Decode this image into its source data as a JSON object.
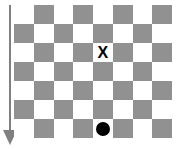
{
  "figure": {
    "title": "",
    "background_color": "#ffffff",
    "width": 178,
    "height": 149
  },
  "arrow": {
    "name": "downward-arrow",
    "direction": "down",
    "color": "#808080",
    "label": ""
  },
  "board": {
    "columns": 8,
    "rows": 7,
    "light_color": "#ffffff",
    "dark_color": "#919191",
    "start_square_color": "light",
    "cells": [
      [
        "light",
        "dark",
        "light",
        "dark",
        "light",
        "dark",
        "light",
        "dark"
      ],
      [
        "dark",
        "light",
        "dark",
        "light",
        "dark",
        "light",
        "dark",
        "light"
      ],
      [
        "light",
        "dark",
        "light",
        "dark",
        "light",
        "dark",
        "light",
        "dark"
      ],
      [
        "dark",
        "light",
        "dark",
        "light",
        "dark",
        "light",
        "dark",
        "light"
      ],
      [
        "light",
        "dark",
        "light",
        "dark",
        "light",
        "dark",
        "light",
        "dark"
      ],
      [
        "dark",
        "light",
        "dark",
        "light",
        "dark",
        "light",
        "dark",
        "light"
      ],
      [
        "light",
        "dark",
        "light",
        "dark",
        "light",
        "dark",
        "light",
        "dark"
      ]
    ]
  },
  "markers": [
    {
      "name": "x-marker",
      "glyph": "X",
      "row": 3,
      "column": 5,
      "square_color": "light",
      "color": "#000000"
    },
    {
      "name": "dot-marker",
      "glyph": "",
      "row": 7,
      "column": 5,
      "square_color": "light",
      "color": "#000000"
    }
  ]
}
